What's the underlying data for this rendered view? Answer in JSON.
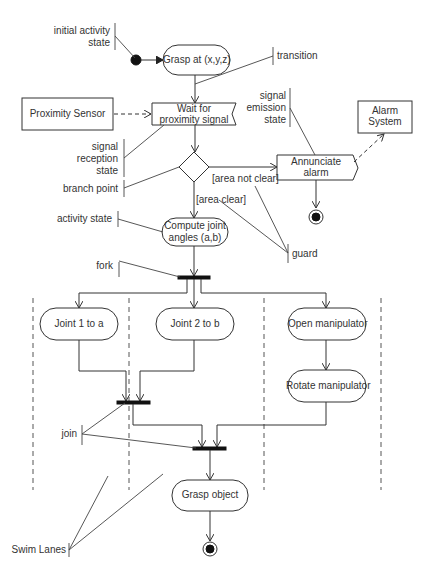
{
  "diagram": {
    "type": "UML activity diagram",
    "nodes": {
      "grasp_at": "Grasp at (x,y,z)",
      "wait_for_1": "Wait for",
      "wait_for_2": "proximity signal",
      "proximity_sensor": "Proximity Sensor",
      "annunciate_1": "Annunciate",
      "annunciate_2": "alarm",
      "alarm_system_1": "Alarm",
      "alarm_system_2": "System",
      "compute_1": "Compute joint",
      "compute_2": "angles (a,b)",
      "joint1": "Joint 1 to a",
      "joint2": "Joint 2 to b",
      "open_manip": "Open manipulator",
      "rotate_manip": "Rotate manipulator",
      "grasp_object": "Grasp object"
    },
    "guards": {
      "not_clear": "[area not clear]",
      "clear": "[area clear]"
    },
    "annotations": {
      "initial_1": "initial activity",
      "initial_2": "state",
      "transition": "transition",
      "emission_1": "signal",
      "emission_2": "emission",
      "emission_3": "state",
      "reception_1": "signal",
      "reception_2": "reception",
      "reception_3": "state",
      "branch": "branch point",
      "activity": "activity state",
      "guard": "guard",
      "fork": "fork",
      "join": "join",
      "swim": "Swim Lanes"
    }
  }
}
